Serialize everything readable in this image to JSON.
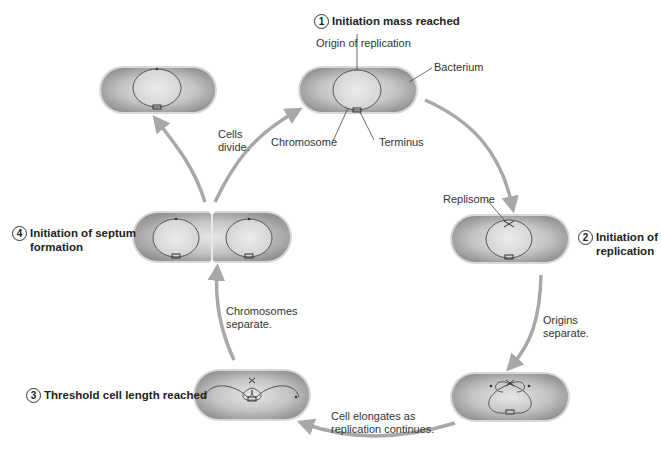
{
  "steps": [
    {
      "number": "1",
      "label": "Initiation mass reached"
    },
    {
      "number": "2",
      "label": "Initiation of replication"
    },
    {
      "number": "3",
      "label": "Threshold cell length reached"
    },
    {
      "number": "4",
      "label": "Initiation of septum formation"
    }
  ],
  "step_lines": {
    "s2_line1": "Initiation of",
    "s2_line2": "replication",
    "s4_line1": "Initiation of septum",
    "s4_line2": "formation"
  },
  "labels": {
    "origin": "Origin of replication",
    "bacterium": "Bacterium",
    "chromosome": "Chromosome",
    "terminus": "Terminus",
    "replisome": "Replisome"
  },
  "transitions": {
    "cells_divide_1": "Cells",
    "cells_divide_2": "divide.",
    "origins_separate_1": "Origins",
    "origins_separate_2": "separate.",
    "elongates_1": "Cell elongates as",
    "elongates_2": "replication continues.",
    "chrom_separate_1": "Chromosomes",
    "chrom_separate_2": "separate."
  },
  "colors": {
    "cell_fill": "#9a9a9a",
    "cell_rim": "#d4d4d4",
    "arrow": "#a8a8a8",
    "chromosome": "#555555"
  }
}
